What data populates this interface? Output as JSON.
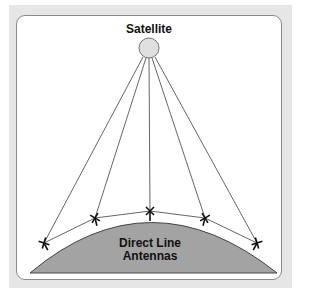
{
  "diagram": {
    "satellite_label": "Satellite",
    "ground_label_line1": "Direct Line",
    "ground_label_line2": "Antennas",
    "colors": {
      "panel": "#e6e6e6",
      "ground": "#a3a3a3",
      "satellite_fill": "#e0e0e0",
      "lines": "#555555"
    },
    "satellite": {
      "cx": 149,
      "cy": 48,
      "r": 10
    },
    "antennas": [
      {
        "x": 44,
        "y": 243
      },
      {
        "x": 95,
        "y": 218
      },
      {
        "x": 150,
        "y": 211
      },
      {
        "x": 205,
        "y": 218
      },
      {
        "x": 257,
        "y": 243
      }
    ]
  }
}
